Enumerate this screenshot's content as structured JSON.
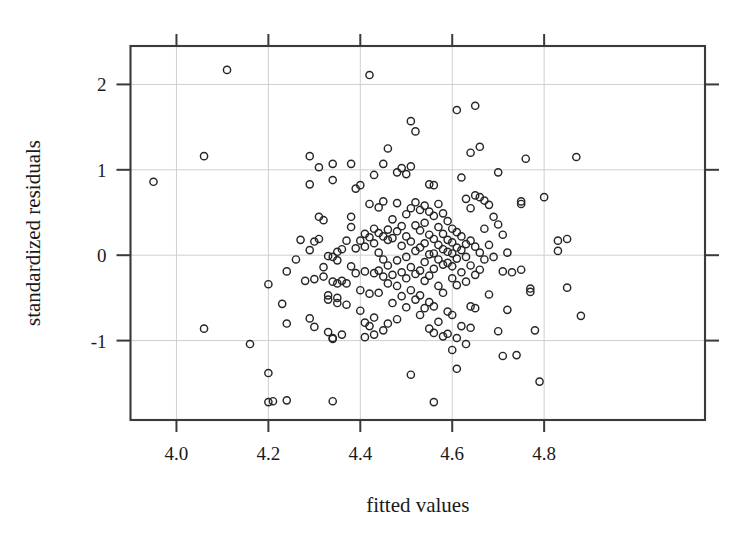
{
  "figure": {
    "kind": "scatter-residual-plot",
    "background": "#ffffff",
    "marker_color": "#262626",
    "grid_color": "#cfcfcf",
    "frame_color": "#3a3a3a"
  },
  "axis": {
    "x_title": "fitted values",
    "y_title": "standardized residuals",
    "x_ticks": [
      "4.0",
      "4.2",
      "4.4",
      "4.6",
      "4.8"
    ],
    "y_ticks": [
      "2",
      "1",
      "0",
      "-1"
    ]
  },
  "chart_data": {
    "type": "scatter",
    "title": "",
    "xlabel": "fitted values",
    "ylabel": "standardized residuals",
    "xlim": [
      3.9,
      5.15
    ],
    "ylim": [
      -1.93,
      2.45
    ],
    "xticks": [
      4.0,
      4.2,
      4.4,
      4.6,
      4.8
    ],
    "yticks": [
      -1,
      0,
      1,
      2
    ],
    "grid": true,
    "legend": null,
    "marker": "open-circle",
    "n_points": 236,
    "points": [
      [
        3.95,
        0.86
      ],
      [
        4.06,
        1.16
      ],
      [
        4.06,
        -0.86
      ],
      [
        4.11,
        2.17
      ],
      [
        4.16,
        -1.04
      ],
      [
        4.2,
        -0.34
      ],
      [
        4.2,
        -1.38
      ],
      [
        4.2,
        -1.72
      ],
      [
        4.21,
        -1.71
      ],
      [
        4.23,
        -0.57
      ],
      [
        4.24,
        -0.19
      ],
      [
        4.24,
        -0.8
      ],
      [
        4.24,
        -1.7
      ],
      [
        4.26,
        -0.05
      ],
      [
        4.27,
        0.18
      ],
      [
        4.28,
        -0.3
      ],
      [
        4.29,
        1.16
      ],
      [
        4.29,
        0.83
      ],
      [
        4.29,
        0.06
      ],
      [
        4.29,
        -0.74
      ],
      [
        4.3,
        0.16
      ],
      [
        4.3,
        -0.28
      ],
      [
        4.3,
        -0.84
      ],
      [
        4.31,
        1.03
      ],
      [
        4.31,
        0.45
      ],
      [
        4.31,
        0.19
      ],
      [
        4.32,
        0.41
      ],
      [
        4.32,
        -0.14
      ],
      [
        4.32,
        -0.25
      ],
      [
        4.33,
        -0.01
      ],
      [
        4.33,
        -0.47
      ],
      [
        4.33,
        -0.52
      ],
      [
        4.33,
        -0.9
      ],
      [
        4.34,
        1.07
      ],
      [
        4.34,
        0.88
      ],
      [
        4.34,
        -0.02
      ],
      [
        4.34,
        -0.31
      ],
      [
        4.34,
        -0.97
      ],
      [
        4.34,
        -0.98
      ],
      [
        4.34,
        -1.71
      ],
      [
        4.35,
        0.04
      ],
      [
        4.35,
        -0.06
      ],
      [
        4.35,
        -0.33
      ],
      [
        4.35,
        -0.5
      ],
      [
        4.35,
        -0.56
      ],
      [
        4.36,
        0.07
      ],
      [
        4.36,
        -0.3
      ],
      [
        4.36,
        -0.93
      ],
      [
        4.37,
        0.17
      ],
      [
        4.37,
        -0.33
      ],
      [
        4.37,
        -0.58
      ],
      [
        4.38,
        1.07
      ],
      [
        4.38,
        0.45
      ],
      [
        4.38,
        0.33
      ],
      [
        4.38,
        -0.13
      ],
      [
        4.39,
        0.78
      ],
      [
        4.39,
        0.08
      ],
      [
        4.39,
        -0.21
      ],
      [
        4.4,
        0.82
      ],
      [
        4.4,
        0.17
      ],
      [
        4.4,
        -0.41
      ],
      [
        4.4,
        -0.65
      ],
      [
        4.41,
        0.25
      ],
      [
        4.41,
        0.1
      ],
      [
        4.41,
        -0.19
      ],
      [
        4.41,
        -0.79
      ],
      [
        4.41,
        -0.96
      ],
      [
        4.42,
        2.11
      ],
      [
        4.42,
        0.6
      ],
      [
        4.42,
        0.21
      ],
      [
        4.42,
        -0.45
      ],
      [
        4.42,
        -0.83
      ],
      [
        4.43,
        0.94
      ],
      [
        4.43,
        0.31
      ],
      [
        4.43,
        0.14
      ],
      [
        4.43,
        -0.21
      ],
      [
        4.43,
        -0.73
      ],
      [
        4.43,
        -0.93
      ],
      [
        4.44,
        0.56
      ],
      [
        4.44,
        0.26
      ],
      [
        4.44,
        0.03
      ],
      [
        4.44,
        -0.18
      ],
      [
        4.44,
        -0.44
      ],
      [
        4.45,
        1.07
      ],
      [
        4.45,
        0.63
      ],
      [
        4.45,
        0.22
      ],
      [
        4.45,
        -0.05
      ],
      [
        4.45,
        -0.25
      ],
      [
        4.45,
        -0.88
      ],
      [
        4.46,
        1.25
      ],
      [
        4.46,
        0.3
      ],
      [
        4.46,
        0.18
      ],
      [
        4.46,
        -0.12
      ],
      [
        4.46,
        -0.33
      ],
      [
        4.46,
        -0.8
      ],
      [
        4.47,
        0.42
      ],
      [
        4.47,
        0.2
      ],
      [
        4.47,
        -0.23
      ],
      [
        4.47,
        -0.56
      ],
      [
        4.48,
        0.97
      ],
      [
        4.48,
        0.61
      ],
      [
        4.48,
        0.28
      ],
      [
        4.48,
        -0.06
      ],
      [
        4.48,
        -0.36
      ],
      [
        4.48,
        -0.75
      ],
      [
        4.49,
        1.02
      ],
      [
        4.49,
        0.34
      ],
      [
        4.49,
        0.11
      ],
      [
        4.49,
        -0.2
      ],
      [
        4.49,
        -0.48
      ],
      [
        4.5,
        0.95
      ],
      [
        4.5,
        0.48
      ],
      [
        4.5,
        0.22
      ],
      [
        4.5,
        -0.02
      ],
      [
        4.5,
        -0.27
      ],
      [
        4.5,
        -0.61
      ],
      [
        4.51,
        1.57
      ],
      [
        4.51,
        1.04
      ],
      [
        4.51,
        0.55
      ],
      [
        4.51,
        0.16
      ],
      [
        4.51,
        -0.14
      ],
      [
        4.51,
        -0.41
      ],
      [
        4.51,
        -1.4
      ],
      [
        4.52,
        1.45
      ],
      [
        4.52,
        0.62
      ],
      [
        4.52,
        0.35
      ],
      [
        4.52,
        0.05
      ],
      [
        4.52,
        -0.22
      ],
      [
        4.52,
        -0.52
      ],
      [
        4.53,
        0.53
      ],
      [
        4.53,
        0.29
      ],
      [
        4.53,
        0.09
      ],
      [
        4.53,
        -0.18
      ],
      [
        4.53,
        -0.47
      ],
      [
        4.53,
        -0.7
      ],
      [
        4.54,
        0.58
      ],
      [
        4.54,
        0.38
      ],
      [
        4.54,
        0.14
      ],
      [
        4.54,
        -0.08
      ],
      [
        4.54,
        -0.3
      ],
      [
        4.54,
        -0.62
      ],
      [
        4.55,
        0.83
      ],
      [
        4.55,
        0.51
      ],
      [
        4.55,
        0.24
      ],
      [
        4.55,
        0.01
      ],
      [
        4.55,
        -0.24
      ],
      [
        4.55,
        -0.55
      ],
      [
        4.55,
        -0.86
      ],
      [
        4.56,
        0.82
      ],
      [
        4.56,
        0.46
      ],
      [
        4.56,
        0.19
      ],
      [
        4.56,
        0.02
      ],
      [
        4.56,
        -0.16
      ],
      [
        4.56,
        -0.6
      ],
      [
        4.56,
        -0.91
      ],
      [
        4.56,
        -1.72
      ],
      [
        4.57,
        0.6
      ],
      [
        4.57,
        0.33
      ],
      [
        4.57,
        0.12
      ],
      [
        4.57,
        -0.05
      ],
      [
        4.57,
        -0.36
      ],
      [
        4.57,
        -0.78
      ],
      [
        4.58,
        0.49
      ],
      [
        4.58,
        0.25
      ],
      [
        4.58,
        0.07
      ],
      [
        4.58,
        -0.11
      ],
      [
        4.58,
        -0.44
      ],
      [
        4.58,
        -0.95
      ],
      [
        4.59,
        0.4
      ],
      [
        4.59,
        0.18
      ],
      [
        4.59,
        0.04
      ],
      [
        4.59,
        -0.09
      ],
      [
        4.59,
        -0.66
      ],
      [
        4.59,
        -0.92
      ],
      [
        4.6,
        0.31
      ],
      [
        4.6,
        0.15
      ],
      [
        4.6,
        0.02
      ],
      [
        4.6,
        -0.13
      ],
      [
        4.6,
        -0.27
      ],
      [
        4.6,
        -0.7
      ],
      [
        4.6,
        -1.11
      ],
      [
        4.61,
        1.7
      ],
      [
        4.61,
        0.27
      ],
      [
        4.61,
        0.09
      ],
      [
        4.61,
        -0.04
      ],
      [
        4.61,
        -0.35
      ],
      [
        4.61,
        -0.97
      ],
      [
        4.61,
        -1.33
      ],
      [
        4.62,
        0.91
      ],
      [
        4.62,
        0.22
      ],
      [
        4.62,
        0.06
      ],
      [
        4.62,
        -0.2
      ],
      [
        4.62,
        -0.83
      ],
      [
        4.63,
        0.66
      ],
      [
        4.63,
        0.13
      ],
      [
        4.63,
        -0.02
      ],
      [
        4.63,
        -0.31
      ],
      [
        4.63,
        -1.04
      ],
      [
        4.64,
        1.2
      ],
      [
        4.64,
        0.55
      ],
      [
        4.64,
        0.17
      ],
      [
        4.64,
        -0.12
      ],
      [
        4.64,
        -0.6
      ],
      [
        4.64,
        -0.85
      ],
      [
        4.65,
        1.75
      ],
      [
        4.65,
        0.7
      ],
      [
        4.65,
        0.1
      ],
      [
        4.65,
        -0.23
      ],
      [
        4.65,
        -0.62
      ],
      [
        4.66,
        1.27
      ],
      [
        4.66,
        0.68
      ],
      [
        4.66,
        0.03
      ],
      [
        4.66,
        -0.17
      ],
      [
        4.67,
        0.64
      ],
      [
        4.67,
        0.31
      ],
      [
        4.67,
        -0.05
      ],
      [
        4.68,
        0.59
      ],
      [
        4.68,
        0.12
      ],
      [
        4.68,
        -0.46
      ],
      [
        4.69,
        0.45
      ],
      [
        4.69,
        -0.02
      ],
      [
        4.7,
        0.97
      ],
      [
        4.7,
        0.36
      ],
      [
        4.7,
        -0.89
      ],
      [
        4.71,
        0.24
      ],
      [
        4.71,
        -0.19
      ],
      [
        4.71,
        -1.18
      ],
      [
        4.72,
        0.03
      ],
      [
        4.72,
        -0.64
      ],
      [
        4.73,
        -0.2
      ],
      [
        4.74,
        -1.17
      ],
      [
        4.75,
        0.63
      ],
      [
        4.75,
        0.6
      ],
      [
        4.75,
        -0.17
      ],
      [
        4.76,
        1.13
      ],
      [
        4.77,
        -0.39
      ],
      [
        4.77,
        -0.43
      ],
      [
        4.78,
        -0.88
      ],
      [
        4.79,
        -1.48
      ],
      [
        4.8,
        0.68
      ],
      [
        4.83,
        0.17
      ],
      [
        4.83,
        0.05
      ],
      [
        4.85,
        0.19
      ],
      [
        4.85,
        -0.38
      ],
      [
        4.87,
        1.15
      ],
      [
        4.88,
        -0.71
      ]
    ]
  }
}
